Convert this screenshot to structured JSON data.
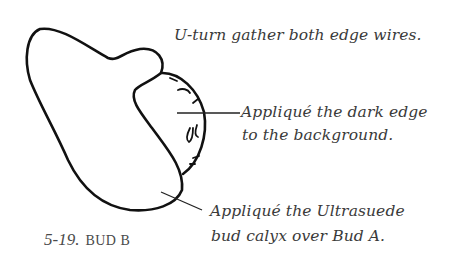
{
  "figure": {
    "number": "5-19.",
    "title": "BUD B"
  },
  "annotations": {
    "top": "U-turn gather both edge wires.",
    "middle": {
      "line1": "Appliqué the dark edge",
      "line2": "to the background."
    },
    "bottom": {
      "line1": "Appliqué the Ultrasuede",
      "line2": "bud calyx over Bud A."
    }
  },
  "colors": {
    "ink": "#111111",
    "text": "#3a3a3a",
    "background": "#ffffff"
  }
}
